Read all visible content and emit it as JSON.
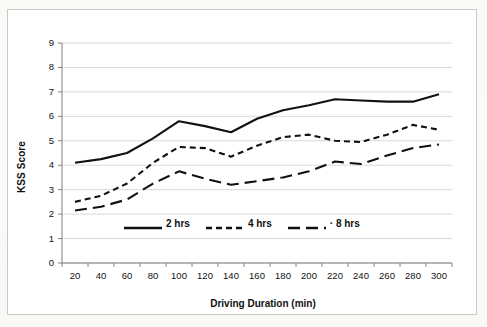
{
  "figure": {
    "axis_y_title": "KSS Score",
    "axis_x_title": "Driving Duration (min)",
    "colors": {
      "line": "#111111",
      "grid": "#d9d9d9",
      "axis": "#808080",
      "frame": "#c9c9c5",
      "background": "#ffffff"
    }
  },
  "chart_data": {
    "type": "line",
    "title": "",
    "xlabel": "Driving Duration (min)",
    "ylabel": "KSS Score",
    "x": [
      20,
      40,
      60,
      80,
      100,
      120,
      140,
      160,
      180,
      200,
      220,
      240,
      260,
      280,
      300
    ],
    "xtick_labels": [
      "20",
      "40",
      "60",
      "80",
      "100",
      "120",
      "140",
      "160",
      "180",
      "200",
      "220",
      "240",
      "260",
      "280",
      "300"
    ],
    "ytick_labels": [
      "0",
      "1",
      "2",
      "3",
      "4",
      "5",
      "6",
      "7",
      "8",
      "9"
    ],
    "ylim": [
      0,
      9
    ],
    "ytick_step": 1,
    "grid": true,
    "legend_position": "inside-lower-center",
    "series": [
      {
        "name": "2 hrs",
        "style": "solid",
        "values": [
          4.1,
          4.25,
          4.5,
          5.1,
          5.8,
          5.6,
          5.35,
          5.9,
          6.25,
          6.45,
          6.7,
          6.65,
          6.6,
          6.6,
          6.9
        ]
      },
      {
        "name": "4 hrs",
        "style": "short-dash",
        "values": [
          2.5,
          2.75,
          3.25,
          4.1,
          4.75,
          4.7,
          4.35,
          4.8,
          5.15,
          5.25,
          5.0,
          4.95,
          5.25,
          5.65,
          5.45
        ]
      },
      {
        "name": "8 hrs",
        "style": "long-dash",
        "values": [
          2.15,
          2.3,
          2.6,
          3.25,
          3.75,
          3.45,
          3.2,
          3.35,
          3.5,
          3.75,
          4.15,
          4.05,
          4.4,
          4.7,
          4.85
        ]
      }
    ]
  },
  "legend": {
    "items": [
      {
        "label": "2 hrs"
      },
      {
        "label": "4 hrs"
      },
      {
        "label": "· 8 hrs"
      }
    ]
  }
}
